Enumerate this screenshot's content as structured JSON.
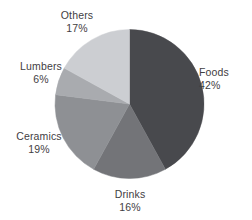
{
  "chart_data": {
    "type": "pie",
    "title": "",
    "subtitle": "",
    "xlabel": "",
    "ylabel": "",
    "legend_position": "none",
    "grid": false,
    "labels_inside": false,
    "start_angle_deg": 0,
    "direction": "clockwise",
    "categories": [
      "Foods",
      "Drinks",
      "Ceramics",
      "Lumbers",
      "Others"
    ],
    "values": [
      42,
      16,
      19,
      6,
      17
    ],
    "value_unit": "%",
    "slices": [
      {
        "name": "Foods",
        "value": 42,
        "percent_label": "42%",
        "color": "#48494d"
      },
      {
        "name": "Drinks",
        "value": 16,
        "percent_label": "16%",
        "color": "#737478"
      },
      {
        "name": "Ceramics",
        "value": 19,
        "percent_label": "19%",
        "color": "#8e9094"
      },
      {
        "name": "Lumbers",
        "value": 6,
        "percent_label": "6%",
        "color": "#a9abaf"
      },
      {
        "name": "Others",
        "value": 17,
        "percent_label": "17%",
        "color": "#ccced2"
      }
    ]
  },
  "colors": {
    "background": "#ffffff",
    "text": "#3f4043",
    "slice_foods": "#48494d",
    "slice_drinks": "#737478",
    "slice_ceramics": "#8e9094",
    "slice_lumbers": "#a9abaf",
    "slice_others": "#ccced2"
  }
}
